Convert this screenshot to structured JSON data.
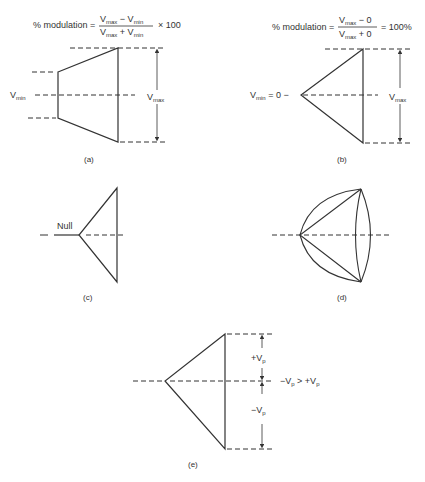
{
  "panels": {
    "a": {
      "formula_prefix": "% modulation =",
      "numerator": [
        "V",
        "max",
        " − V",
        "min"
      ],
      "denominator": [
        "V",
        "max",
        " + V",
        "min"
      ],
      "formula_suffix": "× 100",
      "vmin_label": [
        "V",
        "min"
      ],
      "vmax_label": [
        "V",
        "max"
      ],
      "caption": "(a)"
    },
    "b": {
      "formula_prefix": "% modulation =",
      "numerator": [
        "V",
        "max",
        " − 0"
      ],
      "denominator": [
        "V",
        "max",
        " + 0"
      ],
      "formula_suffix": "= 100%",
      "vmin_label": [
        "V",
        "min",
        " = 0 −"
      ],
      "vmax_label": [
        "V",
        "max"
      ],
      "caption": "(b)"
    },
    "c": {
      "null_label": "Null",
      "caption": "(c)"
    },
    "d": {
      "caption": "(d)"
    },
    "e": {
      "plus_vp": [
        "+V",
        "p"
      ],
      "minus_vp": [
        "−V",
        "p"
      ],
      "relation": [
        "−V",
        "p",
        " > +V",
        "p"
      ],
      "caption": "(e)"
    }
  },
  "colors": {
    "line": "#333333",
    "background": "#ffffff"
  }
}
